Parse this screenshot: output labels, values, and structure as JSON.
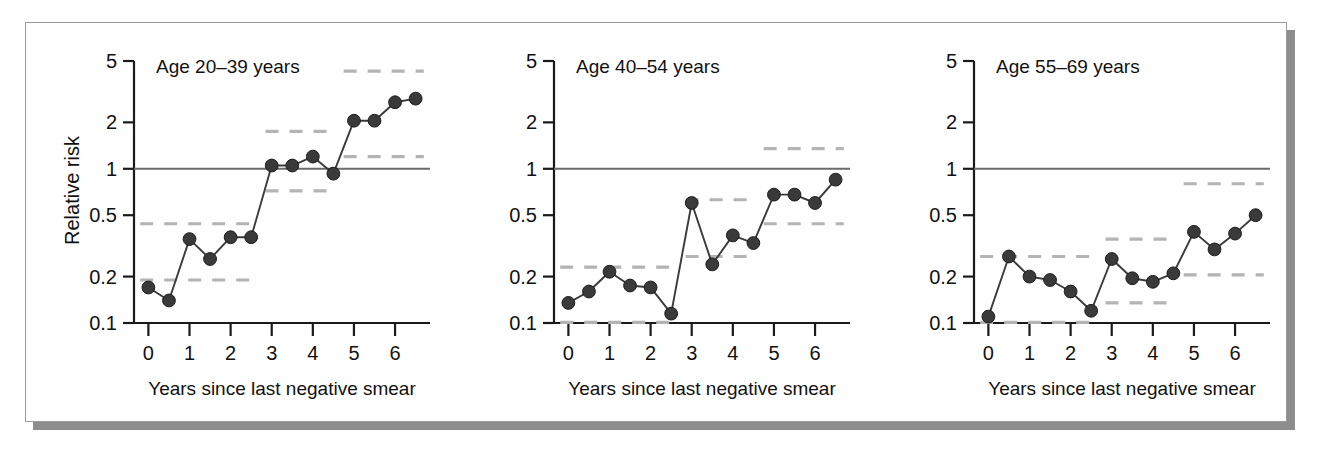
{
  "figure": {
    "y_axis_label": "Relative risk",
    "x_axis_label": "Years since last negative smear",
    "y_tick_labels": [
      "5",
      "2",
      "1",
      "0.5",
      "0.2",
      "0.1"
    ],
    "y_tick_values": [
      5,
      2,
      1,
      0.5,
      0.2,
      0.1
    ],
    "x_tick_labels": [
      "0",
      "1",
      "2",
      "3",
      "4",
      "5",
      "6"
    ],
    "x_tick_values": [
      0,
      1,
      2,
      3,
      4,
      5,
      6
    ],
    "colors": {
      "marker": "#3a3a3a",
      "line": "#3a3a3a",
      "ci_dash": "#b4b4b4",
      "reference_line": "#6b6b6b",
      "axis": "#1a1a1a",
      "frame": "#9a9a9a",
      "shadow": "#8d8d8d",
      "background": "#ffffff"
    }
  },
  "chart_data": [
    {
      "type": "line",
      "title": "Age 20–39 years",
      "xlabel": "Years since last negative smear",
      "ylabel": "Relative risk",
      "yscale": "log",
      "ylim": [
        0.1,
        5
      ],
      "xlim": [
        -0.35,
        6.85
      ],
      "grid": false,
      "legend": "none",
      "reference_line_y": 1,
      "x": [
        0,
        0.5,
        1,
        1.5,
        2,
        2.5,
        3,
        3.5,
        4,
        4.5,
        5,
        5.5,
        6,
        6.5
      ],
      "values": [
        0.17,
        0.14,
        0.35,
        0.26,
        0.36,
        0.36,
        1.05,
        1.05,
        1.2,
        0.93,
        2.05,
        2.05,
        2.7,
        2.85
      ],
      "ci_bands": [
        {
          "x_start": -0.2,
          "x_end": 2.6,
          "upper": 0.44,
          "lower": 0.19
        },
        {
          "x_start": 2.85,
          "x_end": 4.6,
          "upper": 1.75,
          "lower": 0.72
        },
        {
          "x_start": 4.75,
          "x_end": 6.7,
          "upper": 4.3,
          "lower": 1.2
        }
      ]
    },
    {
      "type": "line",
      "title": "Age 40–54 years",
      "xlabel": "Years since last negative smear",
      "ylabel": "Relative risk",
      "yscale": "log",
      "ylim": [
        0.1,
        5
      ],
      "xlim": [
        -0.35,
        6.85
      ],
      "grid": false,
      "legend": "none",
      "reference_line_y": 1,
      "x": [
        0,
        0.5,
        1,
        1.5,
        2,
        2.5,
        3,
        3.5,
        4,
        4.5,
        5,
        5.5,
        6,
        6.5
      ],
      "values": [
        0.135,
        0.16,
        0.215,
        0.175,
        0.17,
        0.115,
        0.6,
        0.24,
        0.37,
        0.33,
        0.68,
        0.68,
        0.6,
        0.85
      ],
      "ci_bands": [
        {
          "x_start": -0.2,
          "x_end": 2.6,
          "upper": 0.23,
          "lower": 0.101
        },
        {
          "x_start": 2.85,
          "x_end": 4.6,
          "upper": 0.63,
          "lower": 0.27
        },
        {
          "x_start": 4.75,
          "x_end": 6.7,
          "upper": 1.35,
          "lower": 0.44
        }
      ]
    },
    {
      "type": "line",
      "title": "Age 55–69 years",
      "xlabel": "Years since last negative smear",
      "ylabel": "Relative risk",
      "yscale": "log",
      "ylim": [
        0.1,
        5
      ],
      "xlim": [
        -0.35,
        6.85
      ],
      "grid": false,
      "legend": "none",
      "reference_line_y": 1,
      "x": [
        0,
        0.5,
        1,
        1.5,
        2,
        2.5,
        3,
        3.5,
        4,
        4.5,
        5,
        5.5,
        6,
        6.5
      ],
      "values": [
        0.11,
        0.27,
        0.2,
        0.19,
        0.16,
        0.12,
        0.26,
        0.195,
        0.185,
        0.21,
        0.39,
        0.3,
        0.38,
        0.5
      ],
      "ci_bands": [
        {
          "x_start": -0.2,
          "x_end": 2.6,
          "upper": 0.27,
          "lower": 0.101
        },
        {
          "x_start": 2.85,
          "x_end": 4.6,
          "upper": 0.35,
          "lower": 0.135
        },
        {
          "x_start": 4.75,
          "x_end": 6.7,
          "upper": 0.8,
          "lower": 0.205
        }
      ]
    }
  ]
}
